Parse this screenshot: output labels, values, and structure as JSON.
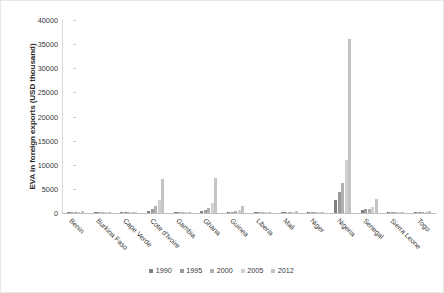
{
  "chart_data": {
    "type": "bar",
    "title": "",
    "xlabel": "",
    "ylabel": "EVA in foreign exports (USD thousand)",
    "ylim": [
      0,
      40000
    ],
    "yticks": [
      0,
      5000,
      10000,
      15000,
      20000,
      25000,
      30000,
      35000,
      40000
    ],
    "ytick_labels": [
      "0",
      "5000",
      "10000",
      "15000",
      "20000",
      "25000",
      "30000",
      "35000",
      "40000"
    ],
    "grid": false,
    "legend_position": "bottom",
    "categories": [
      "Benin",
      "Burkina Faso",
      "Cape Verde",
      "Cote d'Ivoire",
      "Gambia",
      "Ghana",
      "Guinea",
      "Liberia",
      "Mali",
      "Niger",
      "Nigeria",
      "Senegal",
      "Sierra Leone",
      "Togo"
    ],
    "series": [
      {
        "name": "1990",
        "color": "#808080",
        "values": [
          120,
          90,
          40,
          350,
          60,
          400,
          150,
          70,
          110,
          80,
          2600,
          600,
          90,
          130
        ]
      },
      {
        "name": "1995",
        "color": "#9a9a9a",
        "values": [
          150,
          110,
          50,
          900,
          70,
          700,
          250,
          80,
          150,
          100,
          4300,
          750,
          110,
          160
        ]
      },
      {
        "name": "2000",
        "color": "#b0b0b0",
        "values": [
          180,
          140,
          60,
          1400,
          90,
          1100,
          400,
          100,
          190,
          120,
          6200,
          900,
          140,
          200
        ]
      },
      {
        "name": "2005",
        "color": "#d0d0d0",
        "values": [
          220,
          180,
          80,
          2600,
          120,
          2000,
          700,
          140,
          240,
          160,
          11000,
          1300,
          180,
          260
        ]
      },
      {
        "name": "2012",
        "color": "#c4c4c4",
        "values": [
          320,
          260,
          120,
          7100,
          180,
          7200,
          1500,
          260,
          420,
          300,
          36000,
          2900,
          300,
          420
        ]
      }
    ]
  },
  "legend": {
    "items": [
      {
        "label": "1990"
      },
      {
        "label": "1995"
      },
      {
        "label": "2000"
      },
      {
        "label": "2005"
      },
      {
        "label": "2012"
      }
    ]
  }
}
